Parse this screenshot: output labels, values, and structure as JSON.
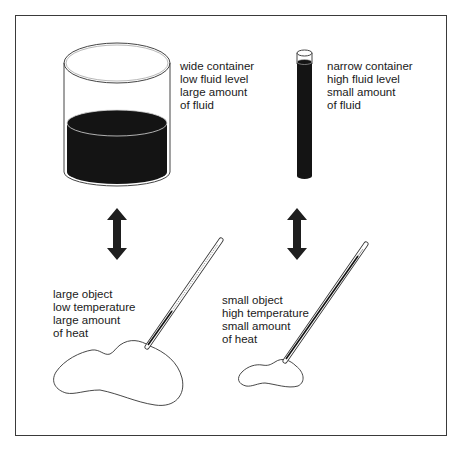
{
  "panels": {
    "wide_container": {
      "lines": [
        "wide container",
        "low fluid level",
        "large amount",
        "of fluid"
      ]
    },
    "narrow_container": {
      "lines": [
        "narrow container",
        "high fluid level",
        "small amount",
        "of fluid"
      ]
    },
    "large_object": {
      "lines": [
        "large object",
        "low temperature",
        "large amount",
        "of heat"
      ]
    },
    "small_object": {
      "lines": [
        "small object",
        "high temperature",
        "small amount",
        "of heat"
      ]
    }
  },
  "colors": {
    "ink": "#1a1a1a",
    "fluid": "#141414",
    "frame": "#3a3a3a",
    "background": "#ffffff"
  }
}
